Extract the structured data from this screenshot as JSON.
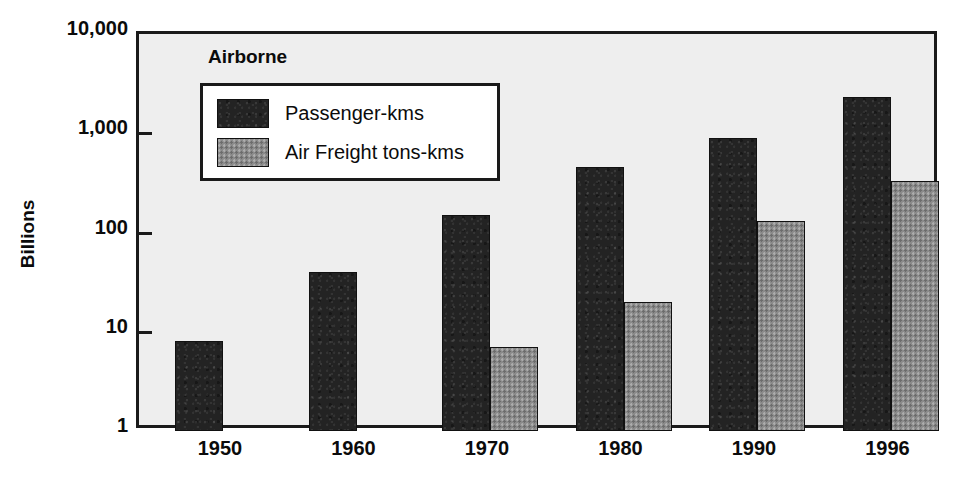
{
  "chart_data": {
    "type": "bar",
    "title": "",
    "legend_title": "Airborne",
    "legend_position": "inside-top-left",
    "xlabel": "",
    "ylabel": "Billions",
    "yscale": "log",
    "ylim": [
      1,
      10000
    ],
    "ytick_labels": [
      "10,000",
      "1,000",
      "100",
      "10",
      "1"
    ],
    "ytick_values": [
      10000,
      1000,
      100,
      10,
      1
    ],
    "grid": false,
    "categories": [
      "1950",
      "1960",
      "1970",
      "1980",
      "1990",
      "1996"
    ],
    "series": [
      {
        "name": "Passenger-kms",
        "color": "#232323",
        "values": [
          8,
          40,
          150,
          460,
          900,
          2300
        ]
      },
      {
        "name": "Air Freight tons-kms",
        "color": "#8a8a8a",
        "values": [
          null,
          null,
          7,
          20,
          130,
          330
        ]
      }
    ]
  },
  "figure": {
    "plot_background": "#eeeeee",
    "frame_color": "#1a1a1a",
    "page_background": "#ffffff"
  }
}
